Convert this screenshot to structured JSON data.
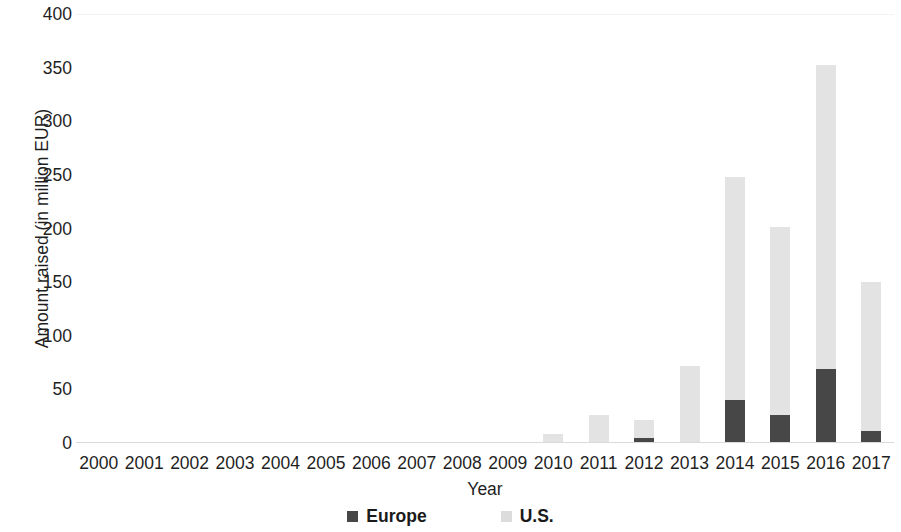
{
  "chart_data": {
    "type": "bar",
    "stacked": true,
    "title": "",
    "xlabel": "Year",
    "ylabel": "Amount raised (in million EUR)",
    "categories": [
      "2000",
      "2001",
      "2002",
      "2003",
      "2004",
      "2005",
      "2006",
      "2007",
      "2008",
      "2009",
      "2010",
      "2011",
      "2012",
      "2013",
      "2014",
      "2015",
      "2016",
      "2017"
    ],
    "series": [
      {
        "name": "Europe",
        "color": "#474747",
        "values": [
          0,
          0,
          0,
          0,
          0,
          0,
          0,
          0,
          0,
          0,
          0,
          0,
          5,
          0,
          40,
          26,
          69,
          11
        ]
      },
      {
        "name": "U.S.",
        "color": "#e3e3e3",
        "values": [
          0,
          0,
          0,
          0,
          0,
          0,
          0,
          0,
          1,
          1,
          8,
          26,
          16,
          72,
          208,
          175,
          283,
          139
        ]
      }
    ],
    "totals": [
      0,
      0,
      0,
      0,
      0,
      0,
      0,
      0,
      1,
      1,
      8,
      26,
      21,
      72,
      248,
      201,
      352,
      150
    ],
    "ylim": [
      0,
      400
    ],
    "yticks": [
      0,
      50,
      100,
      150,
      200,
      250,
      300,
      350,
      400
    ],
    "ytick_labels": [
      "0",
      "50",
      "100",
      "150",
      "200",
      "250",
      "300",
      "350",
      "400"
    ],
    "grid": false,
    "legend_position": "bottom"
  },
  "legend": {
    "items": [
      {
        "label": "Europe",
        "swatch": "legend-swatch-europe"
      },
      {
        "label": "U.S.",
        "swatch": "legend-swatch-us"
      }
    ]
  }
}
